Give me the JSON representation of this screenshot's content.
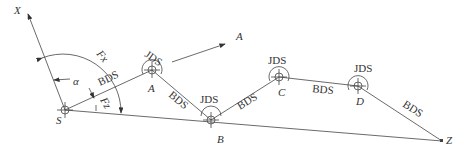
{
  "diagram": {
    "type": "traverse survey sketch",
    "axis_label": "X",
    "angle_alpha": "α",
    "angle_fx": "Fx",
    "angle_fz": "Fz",
    "arrow_label": "A",
    "points": [
      {
        "id": "S",
        "label": "S",
        "x": 65,
        "y": 110
      },
      {
        "id": "A",
        "label": "A",
        "x": 152,
        "y": 70
      },
      {
        "id": "B",
        "label": "B",
        "x": 211,
        "y": 120
      },
      {
        "id": "C",
        "label": "C",
        "x": 279,
        "y": 77
      },
      {
        "id": "D",
        "label": "D",
        "x": 358,
        "y": 86
      },
      {
        "id": "Z",
        "label": "Z",
        "x": 442,
        "y": 141
      }
    ],
    "edge_label": "BDS",
    "station_label": "JDS"
  }
}
